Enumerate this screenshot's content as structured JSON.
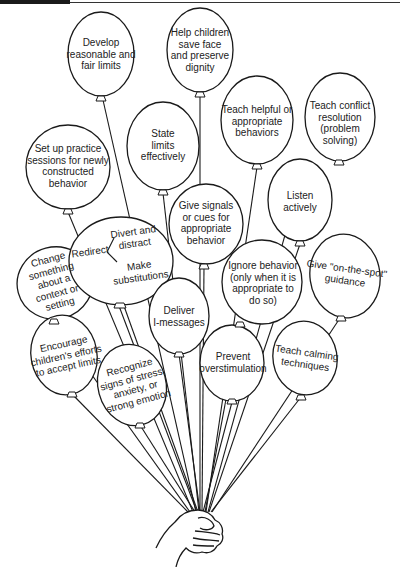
{
  "figure": {
    "balloons": [
      {
        "id": "develop-limits",
        "label": "Develop\nreasonable and\nfair limits"
      },
      {
        "id": "save-face",
        "label": "Help children\nsave face\nand preserve\ndignity"
      },
      {
        "id": "state-limits",
        "label": "State\nlimits\neffectively"
      },
      {
        "id": "teach-helpful",
        "label": "Teach helpful or\nappropriate\nbehaviors"
      },
      {
        "id": "conflict-resolution",
        "label": "Teach conflict\nresolution\n(problem solving)"
      },
      {
        "id": "practice-sessions",
        "label": "Set up practice\nsessions for newly\nconstructed\nbehavior"
      },
      {
        "id": "listen-actively",
        "label": "Listen\nactively"
      },
      {
        "id": "give-signals",
        "label": "Give signals\nor cues for\nappropriate\nbehavior"
      },
      {
        "id": "change-context",
        "label": "Change\nsomething\nabout a\ncontext or\nsetting"
      },
      {
        "id": "redirect",
        "label": "Redirect",
        "branches": [
          "Divert and\ndistract",
          "Make\nsubstitutions"
        ]
      },
      {
        "id": "ignore-behavior",
        "label": "Ignore behavior\n(only when it is\nappropriate to\ndo so)"
      },
      {
        "id": "on-the-spot",
        "label": "Give \"on-the-spot\"\nguidance"
      },
      {
        "id": "encourage-efforts",
        "label": "Encourage\nchildren's efforts\nto accept limits"
      },
      {
        "id": "i-messages",
        "label": "Deliver\nI-messages"
      },
      {
        "id": "recognize-stress",
        "label": "Recognize\nsigns of stress,\nanxiety, or\nstrong emotion"
      },
      {
        "id": "prevent-overstimulation",
        "label": "Prevent\noverstimulation"
      },
      {
        "id": "calming-techniques",
        "label": "Teach calming\ntechniques"
      }
    ],
    "colors": {
      "stroke": "#1a1a1a",
      "fill": "#ffffff",
      "text": "#222222"
    }
  }
}
